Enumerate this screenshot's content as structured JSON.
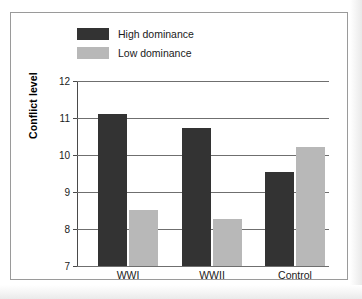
{
  "chart_data": {
    "type": "bar",
    "title": "",
    "xlabel": "",
    "ylabel": "Conflict level",
    "categories": [
      "WWI",
      "WWII",
      "Control"
    ],
    "series": [
      {
        "name": "High dominance",
        "color": "#333333",
        "values": [
          11.12,
          10.72,
          9.55
        ]
      },
      {
        "name": "Low dominance",
        "color": "#b8b8b8",
        "values": [
          8.52,
          8.27,
          10.22
        ]
      }
    ],
    "ylim": [
      7,
      12
    ],
    "yticks": [
      "12",
      "11",
      "10",
      "9",
      "8",
      "7"
    ],
    "grid": true,
    "legend_position": "top-left"
  },
  "legend": {
    "items": [
      {
        "label": "High dominance"
      },
      {
        "label": "Low dominance"
      }
    ]
  },
  "axes": {
    "y_title": "Conflict level"
  }
}
